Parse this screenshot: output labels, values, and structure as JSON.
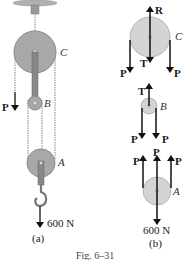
{
  "figure": {
    "caption": "Fig. 6–31",
    "colors": {
      "pulley_fill": "#a8a8a8",
      "pulley_stroke": "#8a8a8a",
      "pulley_fb_fill": "#d4d4d4",
      "rope": "#9a9a9a",
      "arrow": "#111111",
      "support": "#b0b0b0"
    }
  },
  "panel_a": {
    "label": "(a)",
    "pulleys": {
      "C": "C",
      "B": "B",
      "A": "A"
    },
    "force_P": "P",
    "load": "600 N"
  },
  "panel_b": {
    "label": "(b)",
    "pulley_C": {
      "name": "C",
      "reaction": "R",
      "tension": "T",
      "left_force": "P",
      "right_force": "P"
    },
    "pulley_B": {
      "name": "B",
      "tension": "T",
      "left_force": "P",
      "right_force": "P"
    },
    "pulley_A": {
      "name": "A",
      "left_force": "P",
      "center_force": "P",
      "right_force": "P",
      "load": "600 N"
    }
  }
}
